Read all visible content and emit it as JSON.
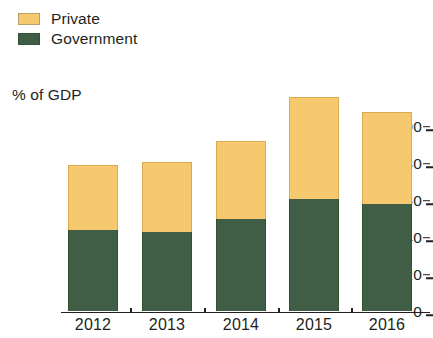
{
  "chart_data": {
    "type": "bar",
    "subtype": "stacked-vertical",
    "title": "",
    "subtitle": "",
    "xlabel": "",
    "ylabel": "% of GDP",
    "categories": [
      "2012",
      "2013",
      "2014",
      "2015",
      "2016"
    ],
    "series": [
      {
        "name": "Government",
        "color": "#405e46",
        "values": [
          44,
          43,
          50,
          61,
          58
        ]
      },
      {
        "name": "Private",
        "color": "#f6c96e",
        "values": [
          35,
          38,
          42,
          55,
          50
        ]
      }
    ],
    "totals": [
      79,
      81,
      92,
      116,
      108
    ],
    "ylim": [
      0,
      120
    ],
    "yticks": [
      0,
      20,
      40,
      60,
      80,
      100
    ],
    "ytick_labels": [
      "0",
      "20",
      "40",
      "60",
      "80",
      "100"
    ],
    "grid": false,
    "legend_position": "top-left",
    "legend_entries": [
      "Private",
      "Government"
    ],
    "annotations": []
  },
  "legend": {
    "items": [
      {
        "label": "Private",
        "color": "#f6c96e"
      },
      {
        "label": "Government",
        "color": "#405e46"
      }
    ]
  },
  "axis": {
    "y_title": "% of GDP"
  }
}
